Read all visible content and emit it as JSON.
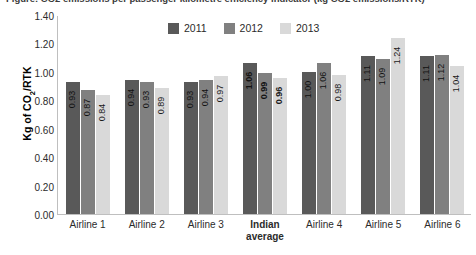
{
  "chart_data": {
    "type": "bar",
    "title": "Figure: CO2 emissions per passenger kilometre efficiency indicator (kg CO2 emissions/RTK)",
    "xlabel": "",
    "ylabel": "Kg of CO2/RTK",
    "ylabel_prefix": "Kg of CO",
    "ylabel_sub": "2",
    "ylabel_suffix": "/RTK",
    "ylim": [
      0.0,
      1.4
    ],
    "ytick_step": 0.2,
    "ytick_labels": [
      "0.00",
      "0.20",
      "0.40",
      "0.60",
      "0.80",
      "1.00",
      "1.20",
      "1.40"
    ],
    "grid": false,
    "legend_position": "top-center",
    "categories": [
      "Airline 1",
      "Airline 2",
      "Airline 3",
      "Indian average",
      "Airline 4",
      "Airline 5",
      "Airline 6"
    ],
    "category_lines": [
      [
        "Airline 1"
      ],
      [
        "Airline 2"
      ],
      [
        "Airline 3"
      ],
      [
        "Indian",
        "average"
      ],
      [
        "Airline 4"
      ],
      [
        "Airline 5"
      ],
      [
        "Airline 6"
      ]
    ],
    "emphasis_category": "Indian average",
    "series": [
      {
        "name": "2011",
        "color": "#595959",
        "values": [
          0.93,
          0.94,
          0.93,
          1.06,
          1.0,
          1.11,
          1.11
        ],
        "labels": [
          "0.93",
          "0.94",
          "0.93",
          "1.06",
          "1.00",
          "1.11",
          "1.11"
        ]
      },
      {
        "name": "2012",
        "color": "#808080",
        "values": [
          0.87,
          0.93,
          0.94,
          0.99,
          1.06,
          1.09,
          1.12
        ],
        "labels": [
          "0.87",
          "0.93",
          "0.94",
          "0.99",
          "1.06",
          "1.09",
          "1.12"
        ]
      },
      {
        "name": "2013",
        "color": "#d9d9d9",
        "values": [
          0.84,
          0.89,
          0.97,
          0.96,
          0.98,
          1.24,
          1.04
        ],
        "labels": [
          "0.84",
          "0.89",
          "0.97",
          "0.96",
          "0.98",
          "1.24",
          "1.04"
        ]
      }
    ]
  }
}
